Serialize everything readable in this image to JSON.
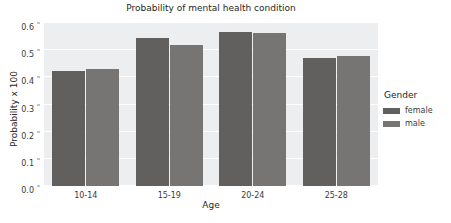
{
  "chart_data": {
    "type": "bar",
    "title": "Probability of mental health condition",
    "xlabel": "Age",
    "ylabel": "Probability x 100",
    "categories": [
      "10-14",
      "15-19",
      "20-24",
      "25-28"
    ],
    "series": [
      {
        "name": "female",
        "values": [
          0.425,
          0.545,
          0.568,
          0.473
        ],
        "color": "#61605f"
      },
      {
        "name": "male",
        "values": [
          0.429,
          0.52,
          0.562,
          0.477
        ],
        "color": "#767573"
      }
    ],
    "legend_title": "Gender",
    "legend_position": "right",
    "ylim": [
      0.0,
      0.6
    ],
    "yticks": [
      "0.0",
      "0.1",
      "0.2",
      "0.3",
      "0.4",
      "0.5",
      "0.6"
    ],
    "ytick_values": [
      0.0,
      0.1,
      0.2,
      0.3,
      0.4,
      0.5,
      0.6
    ],
    "grid": true,
    "grid_color": "#ffffff",
    "plot_background": "#eceef0",
    "figure_background": "#ffffff"
  }
}
